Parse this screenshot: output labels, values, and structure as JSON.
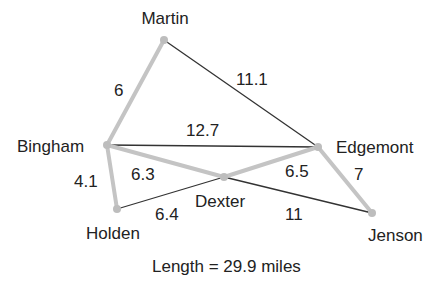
{
  "graph": {
    "nodes": [
      {
        "id": "martin",
        "label": "Martin",
        "x": 164,
        "y": 40,
        "lx": 165,
        "ly": 24,
        "anchor": "middle"
      },
      {
        "id": "bingham",
        "label": "Bingham",
        "x": 107,
        "y": 145,
        "lx": 17,
        "ly": 152,
        "anchor": "start"
      },
      {
        "id": "edgemont",
        "label": "Edgemont",
        "x": 318,
        "y": 147,
        "lx": 336,
        "ly": 153,
        "anchor": "start"
      },
      {
        "id": "dexter",
        "label": "Dexter",
        "x": 224,
        "y": 177,
        "lx": 195,
        "ly": 207,
        "anchor": "start"
      },
      {
        "id": "holden",
        "label": "Holden",
        "x": 117,
        "y": 209,
        "lx": 86,
        "ly": 239,
        "anchor": "start"
      },
      {
        "id": "jenson",
        "label": "Jenson",
        "x": 372,
        "y": 213,
        "lx": 368,
        "ly": 241,
        "anchor": "start"
      }
    ],
    "edges": [
      {
        "from": "martin",
        "to": "bingham",
        "weight": "6",
        "highlighted": true,
        "lx": 114,
        "ly": 96
      },
      {
        "from": "martin",
        "to": "edgemont",
        "weight": "11.1",
        "highlighted": false,
        "lx": 236,
        "ly": 85
      },
      {
        "from": "bingham",
        "to": "edgemont",
        "weight": "12.7",
        "highlighted": false,
        "lx": 186,
        "ly": 136
      },
      {
        "from": "bingham",
        "to": "dexter",
        "weight": "6.3",
        "highlighted": true,
        "lx": 131,
        "ly": 180
      },
      {
        "from": "dexter",
        "to": "edgemont",
        "weight": "6.5",
        "highlighted": true,
        "lx": 285,
        "ly": 177
      },
      {
        "from": "edgemont",
        "to": "jenson",
        "weight": "7",
        "highlighted": true,
        "lx": 354,
        "ly": 180
      },
      {
        "from": "bingham",
        "to": "holden",
        "weight": "4.1",
        "highlighted": true,
        "lx": 74,
        "ly": 187
      },
      {
        "from": "holden",
        "to": "dexter",
        "weight": "6.4",
        "highlighted": false,
        "lx": 155,
        "ly": 220
      },
      {
        "from": "dexter",
        "to": "jenson",
        "weight": "11",
        "highlighted": false,
        "lx": 285,
        "ly": 220
      }
    ]
  },
  "caption": "Length = 29.9 miles",
  "colors": {
    "highlight": "#c4c4c4",
    "edge": "#333333",
    "node": "#bdbdbd",
    "text": "#222222"
  }
}
